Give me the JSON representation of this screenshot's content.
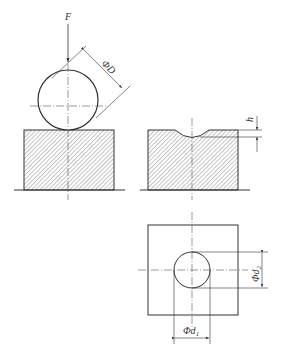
{
  "diagram": {
    "type": "engineering-drawing",
    "colors": {
      "line": "#333333",
      "hatch": "#8a8a8a",
      "center": "#555555"
    },
    "views": [
      {
        "id": "loading-view",
        "labels": {
          "force": "F",
          "ball_diameter": "ΦD"
        }
      },
      {
        "id": "indentation-section",
        "labels": {
          "depth": "h"
        }
      },
      {
        "id": "indentation-top-view",
        "labels": {
          "d1": "Φd",
          "d1_sub": "1",
          "d2": "Φd",
          "d2_sub": "2"
        }
      }
    ]
  }
}
